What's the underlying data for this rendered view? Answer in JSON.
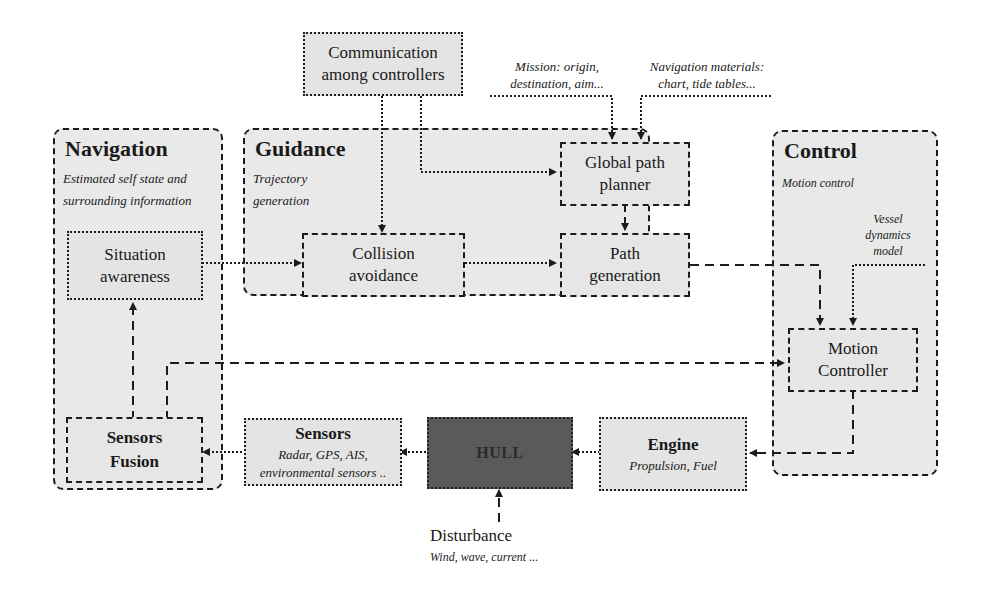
{
  "diagram": {
    "groups": {
      "navigation": {
        "title": "Navigation",
        "subtitle_line1": "Estimated self state and",
        "subtitle_line2": "surrounding information"
      },
      "guidance": {
        "title": "Guidance",
        "subtitle_line1": "Trajectory",
        "subtitle_line2": "generation"
      },
      "control": {
        "title": "Control",
        "subtitle": "Motion control"
      }
    },
    "blocks": {
      "communication": {
        "line1": "Communication",
        "line2": "among controllers"
      },
      "situation_awareness": {
        "line1": "Situation",
        "line2": "awareness"
      },
      "collision_avoidance": {
        "line1": "Collision",
        "line2": "avoidance"
      },
      "global_path_planner": {
        "line1": "Global path",
        "line2": "planner"
      },
      "path_generation": {
        "line1": "Path",
        "line2": "generation"
      },
      "motion_controller": {
        "line1": "Motion",
        "line2": "Controller"
      },
      "sensors_fusion": {
        "line1": "Sensors",
        "line2": "Fusion"
      },
      "sensors": {
        "title": "Sensors",
        "line1": "Radar, GPS, AIS,",
        "line2": "environmental sensors .."
      },
      "hull": {
        "title": "HULL"
      },
      "engine": {
        "title": "Engine",
        "subtitle": "Propulsion, Fuel"
      }
    },
    "notes": {
      "mission": {
        "line1": "Mission: origin,",
        "line2": "destination, aim..."
      },
      "nav_materials": {
        "line1": "Navigation materials:",
        "line2": "chart, tide tables..."
      },
      "vessel_model": {
        "line1": "Vessel",
        "line2": "dynamics",
        "line3": "model"
      },
      "disturbance": {
        "title": "Disturbance",
        "subtitle": "Wind, wave, current ..."
      }
    },
    "colors": {
      "group_fill": "#e9e9e9",
      "box_fill": "#e4e4e4",
      "hull_fill": "#5a5a5a",
      "stroke": "#1c1c1c"
    }
  }
}
